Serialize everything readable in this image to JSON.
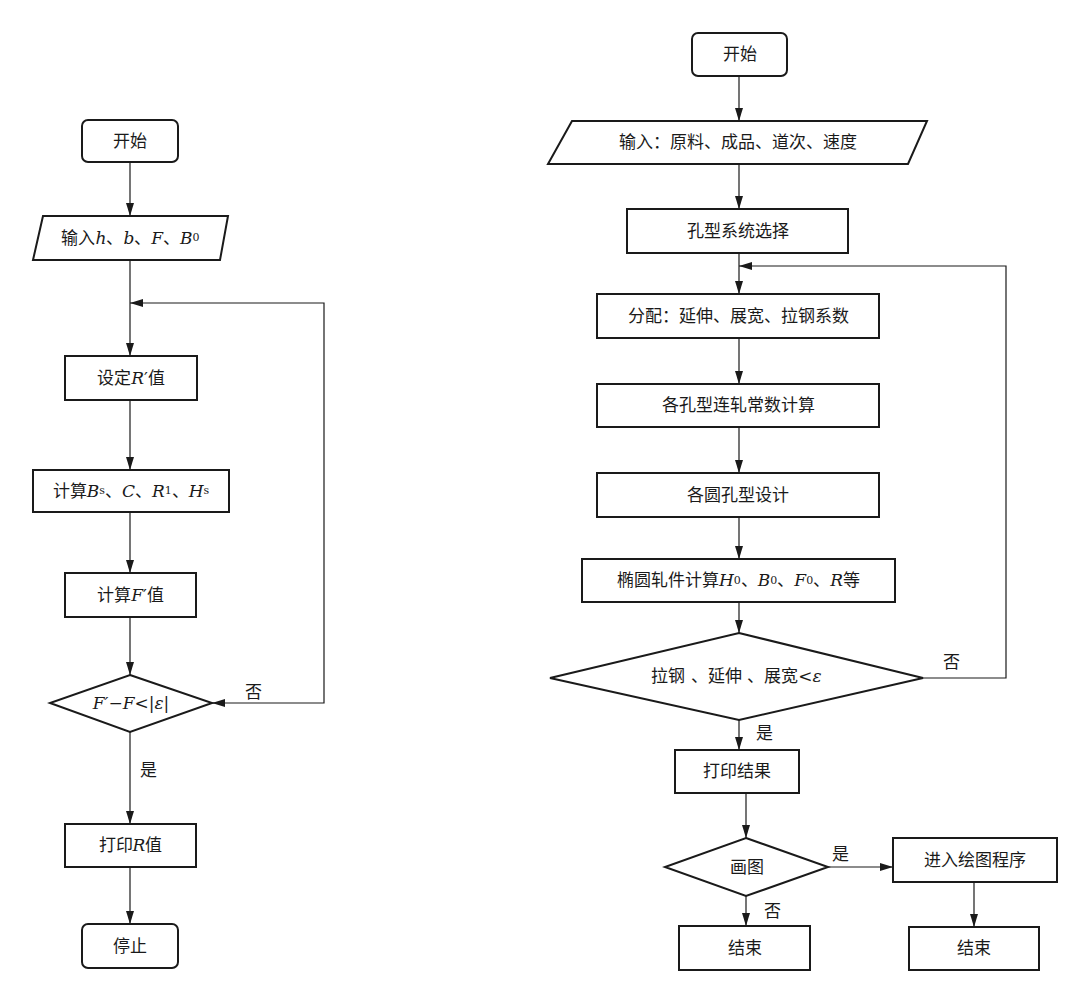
{
  "left_flowchart": {
    "start": "开始",
    "input": {
      "prefix": "输入 ",
      "vars": [
        "h",
        "b",
        "F",
        "B"
      ],
      "sub_last": "0",
      "sep": "、"
    },
    "set_r": {
      "prefix": "设定 ",
      "var": "R",
      "prime": "′",
      "suffix": "值"
    },
    "calc_params": {
      "prefix": "计算",
      "v1": "B",
      "v1_sub": "s",
      "v2": "C",
      "v3": "R",
      "v3_sub": "1",
      "v4": "H",
      "v4_sub": "s",
      "sep": "、"
    },
    "calc_f": {
      "prefix": "计算 ",
      "var": "F",
      "prime": "′",
      "suffix": "值"
    },
    "decision": {
      "lhs": "F′−F",
      "op": "<",
      "rhs": "|ε|"
    },
    "no_label": "否",
    "yes_label": "是",
    "print": {
      "prefix": "打印 ",
      "var": "R",
      "suffix": " 值"
    },
    "stop": "停止"
  },
  "right_flowchart": {
    "start": "开始",
    "input": "输入：原料、成品、道次、速度",
    "pass_system": "孔型系统选择",
    "distribute": "分配：延伸、展宽、拉钢系数",
    "tandem_constant": "各孔型连轧常数计算",
    "round_pass_design": "各圆孔型设计",
    "oval_calc": {
      "prefix": "椭圆轧件计算 ",
      "v1": "H",
      "v2": "B",
      "v3": "F",
      "sub": "0",
      "v4": "R",
      "suffix": "等",
      "sep": "、"
    },
    "decision": {
      "text": "拉钢 、延伸 、展宽",
      "op": "<",
      "var": "ε"
    },
    "no_label": "否",
    "yes_label": "是",
    "print_result": "打印结果",
    "draw_decision": "画图",
    "draw_yes_label": "是",
    "draw_no_label": "否",
    "enter_drawing": "进入绘图程序",
    "end_left": "结束",
    "end_right": "结束"
  },
  "colors": {
    "line": "#1a1a1a",
    "background": "#ffffff"
  }
}
